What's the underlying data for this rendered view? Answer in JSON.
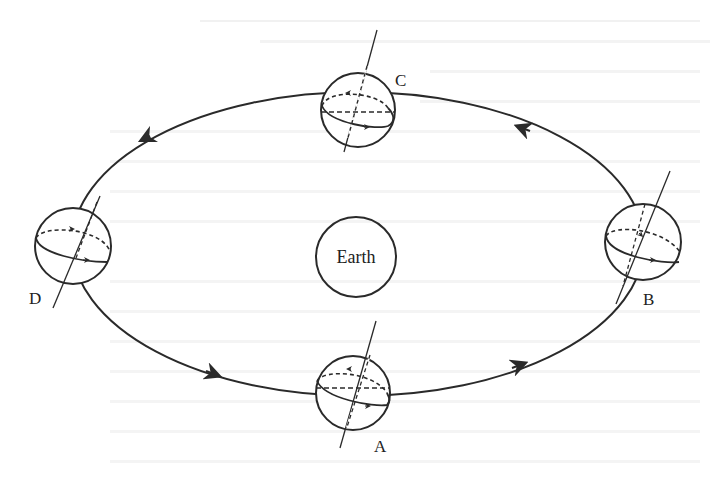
{
  "figure": {
    "type": "orbit-diagram",
    "central_body": {
      "label": "Earth"
    },
    "orbit": {
      "direction": "counterclockwise",
      "arrow_count": 4
    },
    "positions": [
      {
        "id": "A",
        "label": "A"
      },
      {
        "id": "B",
        "label": "B"
      },
      {
        "id": "C",
        "label": "C"
      },
      {
        "id": "D",
        "label": "D"
      }
    ]
  },
  "background_bleed_through": true,
  "colors": {
    "ink": "#2a2a2a",
    "paper": "#ffffff",
    "bleed": "#ececec"
  }
}
